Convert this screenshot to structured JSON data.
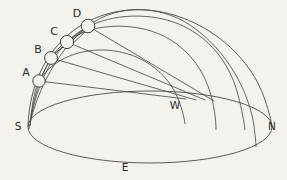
{
  "figure": {
    "type": "diagram",
    "background_color": "#f3f2ed",
    "line_color": "#4a4a4a",
    "label_color": "#2b2b2b",
    "node_fill_color": "#f3f2ed"
  },
  "cardinal_points": [
    {
      "id": "south",
      "label": "S",
      "x": 18,
      "y": 127
    },
    {
      "id": "west",
      "label": "W",
      "x": 175,
      "y": 106
    },
    {
      "id": "north",
      "label": "N",
      "x": 272,
      "y": 127
    },
    {
      "id": "east",
      "label": "E",
      "x": 125,
      "y": 168
    }
  ],
  "nodes": [
    {
      "id": "A",
      "label": "A",
      "cx": 39,
      "cy": 81,
      "r": 6.2,
      "label_x": 26,
      "label_y": 73
    },
    {
      "id": "B",
      "label": "B",
      "cx": 51,
      "cy": 58,
      "r": 6.4,
      "label_x": 38,
      "label_y": 50
    },
    {
      "id": "C",
      "label": "C",
      "cx": 67,
      "cy": 42,
      "r": 6.6,
      "label_x": 54,
      "label_y": 32
    },
    {
      "id": "D",
      "label": "D",
      "cx": 88,
      "cy": 26,
      "r": 6.8,
      "label_x": 77,
      "label_y": 14
    }
  ],
  "horizon": {
    "id": "horizon-ellipse",
    "cx": 150,
    "cy": 127,
    "rx": 122,
    "ry": 36
  },
  "dome": {
    "id": "meridian-outline",
    "path": "M 28 127 C 30 60 72 14 130 10 C 190 6 248 48 265 100 C 269 112 271 120 272 127"
  },
  "arcs": [
    {
      "id": "arc-A",
      "through": "A",
      "path": "M 31 116 C 33 100 35 88 39 81 C 50 62 76 49 104 50 C 136 51 163 68 176 94 C 181 105 184 116 185 124"
    },
    {
      "id": "arc-B",
      "through": "B",
      "path": "M 30 122 C 33 100 40 76 51 58 C 66 34 98 23 132 27 C 170 31 199 56 210 92 C 214 105 216 119 216 130"
    },
    {
      "id": "arc-C",
      "through": "C",
      "path": "M 30 126 C 33 100 44 66 67 42 C 88 20 124 12 158 18 C 198 25 228 55 238 95 C 242 110 244 122 245 130"
    },
    {
      "id": "arc-D",
      "through": "D",
      "path": "M 29 129 C 33 104 52 54 88 26 C 118 3 164 4 197 30 C 233 58 250 98 254 126 C 255 135 256 142 256 147"
    }
  ],
  "connectors": [
    {
      "id": "connector-A-B",
      "from": "A",
      "to": "B",
      "x1": 39,
      "y1": 81,
      "x2": 51,
      "y2": 58
    },
    {
      "id": "connector-B-C",
      "from": "B",
      "to": "C",
      "x1": 51,
      "y1": 58,
      "x2": 67,
      "y2": 42
    },
    {
      "id": "connector-C-D",
      "from": "C",
      "to": "D",
      "x1": 67,
      "y1": 42,
      "x2": 88,
      "y2": 26
    },
    {
      "id": "connector-B-D",
      "from": "B",
      "to": "D",
      "x1": 54,
      "y1": 54,
      "x2": 85,
      "y2": 30
    },
    {
      "id": "connector-C-D-lower",
      "from": "C",
      "to": "D",
      "x1": 70,
      "y1": 46,
      "x2": 86,
      "y2": 31
    }
  ],
  "chord_lines": [
    {
      "id": "chord-A-west",
      "x1": 39,
      "y1": 81,
      "x2": 186,
      "y2": 99
    },
    {
      "id": "chord-B-west",
      "x1": 51,
      "y1": 58,
      "x2": 196,
      "y2": 100
    },
    {
      "id": "chord-C-west",
      "x1": 67,
      "y1": 42,
      "x2": 205,
      "y2": 100
    },
    {
      "id": "chord-D-west",
      "x1": 88,
      "y1": 26,
      "x2": 214,
      "y2": 101
    }
  ]
}
